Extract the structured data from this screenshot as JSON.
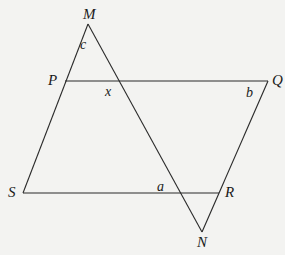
{
  "diagram": {
    "vertices": {
      "M": "M",
      "P": "P",
      "Q": "Q",
      "S": "S",
      "R": "R",
      "N": "N"
    },
    "angles": {
      "c": "c",
      "x": "x",
      "b": "b",
      "a": "a"
    },
    "segments": [
      "MS",
      "PQ",
      "QR",
      "SR",
      "MN",
      "RN"
    ],
    "colors": {
      "line": "#2a2a2a",
      "background": "#f3f3f1"
    }
  }
}
